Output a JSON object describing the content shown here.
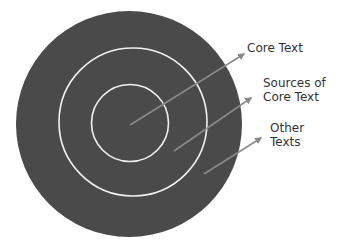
{
  "diagram": {
    "type": "concentric-circles",
    "colors": {
      "fill": "#4a4a4a",
      "rings": "#ffffff",
      "arrows": "#8a8a8a",
      "text": "#333333"
    },
    "layers": [
      {
        "name": "core",
        "label": "Core Text"
      },
      {
        "name": "sources",
        "label_line1": "Sources of",
        "label_line2": "Core Text"
      },
      {
        "name": "other",
        "label_line1": "Other",
        "label_line2": "Texts"
      }
    ]
  }
}
